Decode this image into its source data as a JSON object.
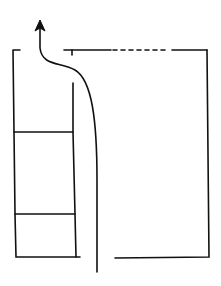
{
  "diagram": {
    "title": "",
    "colors": {
      "stroke": "#111111",
      "background": "#ffffff"
    },
    "elements": {
      "outer_enclosure": "rectangular outline with an opening at the top-left",
      "top_wall_dashed_segment": "dashed section of the top wall",
      "inner_partition": "vertical partition left of center",
      "left_compartments": 3,
      "bottom_gap": "opening in bottom wall where the flow line enters",
      "flow_arrow": "curved arrow entering from bottom, exiting upward through top opening"
    }
  }
}
